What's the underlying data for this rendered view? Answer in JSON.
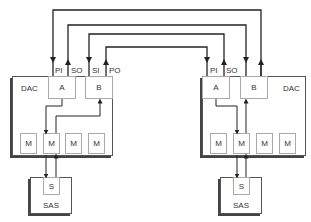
{
  "diagram": {
    "type": "dual-controller interconnect",
    "colors": {
      "line": "#222222",
      "box_border": "#555555",
      "sub_border": "#aaaaaa",
      "text": "#333333"
    },
    "left_controller": {
      "label": "DAC",
      "unit_a": {
        "label": "A",
        "ports": [
          "PI",
          "SO"
        ]
      },
      "unit_b": {
        "label": "B",
        "ports": [
          "SI",
          "PO"
        ]
      },
      "modules": [
        "M",
        "M",
        "M",
        "M"
      ],
      "storage": {
        "label": "SAS",
        "inner": "S"
      }
    },
    "right_controller": {
      "label": "DAC",
      "unit_a": {
        "label": "A",
        "ports": [
          "PI",
          "SO"
        ]
      },
      "unit_b": {
        "label": "B",
        "ports": []
      },
      "modules": [
        "M",
        "M",
        "M",
        "M"
      ],
      "storage": {
        "label": "SAS",
        "inner": "S"
      }
    },
    "connections": [
      {
        "from": "right.B (up arrow, outermost)",
        "to": "left.PI"
      },
      {
        "from": "left.SO",
        "to": "right.B (down arrow)"
      },
      {
        "from": "right.SO",
        "to": "left.SI"
      },
      {
        "from": "left.PO",
        "to": "right.PI"
      }
    ]
  }
}
